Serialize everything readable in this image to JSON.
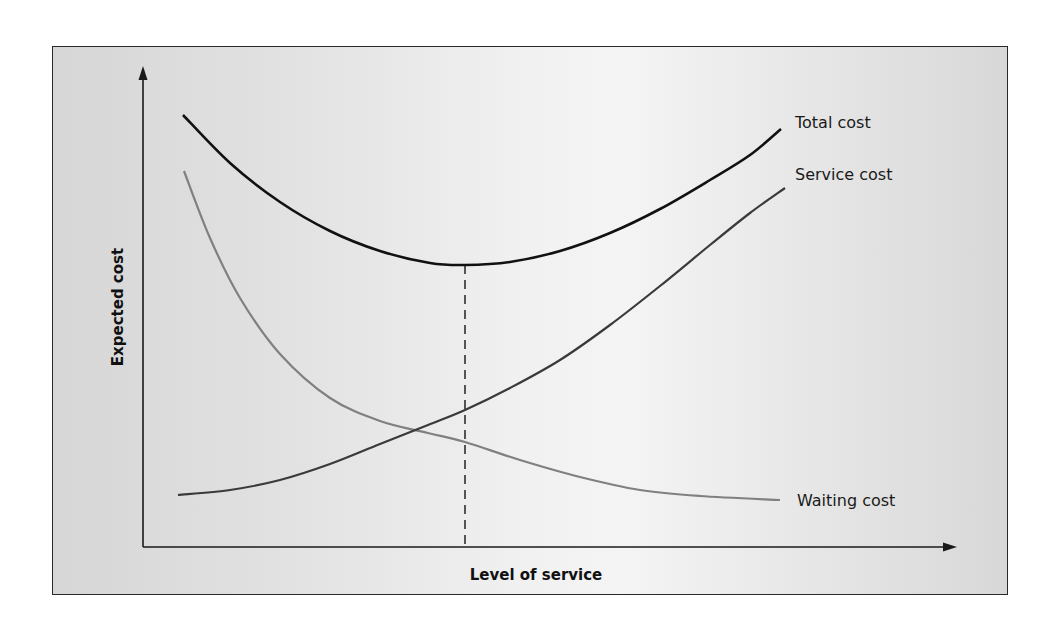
{
  "chart_data": {
    "type": "line",
    "title": "",
    "xlabel": "Level of service",
    "ylabel": "Expected cost",
    "grid": false,
    "ticks": "none",
    "legend": "inline labels at right end of each curve",
    "x_range_px": [
      143,
      957
    ],
    "y_range_px": [
      66,
      547
    ],
    "optimum_marker": {
      "type": "dashed vertical line",
      "x_fraction": 0.395,
      "description": "Level of service at minimum total cost"
    },
    "series": [
      {
        "name": "Total cost",
        "color": "#111111",
        "shape": "U-shaped; decreases then increases, minimum at optimum",
        "points_px": [
          [
            183,
            115
          ],
          [
            230,
            163
          ],
          [
            280,
            202
          ],
          [
            330,
            231
          ],
          [
            380,
            251
          ],
          [
            430,
            263
          ],
          [
            465,
            265
          ],
          [
            510,
            262
          ],
          [
            560,
            251
          ],
          [
            610,
            233
          ],
          [
            660,
            209
          ],
          [
            710,
            180
          ],
          [
            750,
            155
          ],
          [
            781,
            129
          ]
        ]
      },
      {
        "name": "Service cost",
        "color": "#333333",
        "shape": "increasing, convex",
        "points_px": [
          [
            178,
            495
          ],
          [
            230,
            490
          ],
          [
            280,
            480
          ],
          [
            330,
            464
          ],
          [
            380,
            444
          ],
          [
            428,
            425
          ],
          [
            465,
            410
          ],
          [
            510,
            388
          ],
          [
            560,
            360
          ],
          [
            610,
            325
          ],
          [
            660,
            286
          ],
          [
            710,
            245
          ],
          [
            750,
            213
          ],
          [
            785,
            188
          ]
        ]
      },
      {
        "name": "Waiting cost",
        "color": "#7a7a7a",
        "shape": "decreasing, convex, flattening",
        "points_px": [
          [
            184,
            171
          ],
          [
            210,
            238
          ],
          [
            240,
            298
          ],
          [
            280,
            354
          ],
          [
            330,
            398
          ],
          [
            380,
            421
          ],
          [
            428,
            433
          ],
          [
            465,
            442
          ],
          [
            520,
            460
          ],
          [
            580,
            477
          ],
          [
            640,
            490
          ],
          [
            700,
            496
          ],
          [
            780,
            500
          ]
        ]
      }
    ]
  },
  "labels": {
    "total_cost": "Total cost",
    "service_cost": "Service cost",
    "waiting_cost": "Waiting cost",
    "y_axis": "Expected cost",
    "x_axis": "Level of service"
  }
}
